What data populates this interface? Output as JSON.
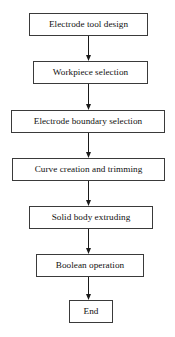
{
  "diagram": {
    "type": "flowchart",
    "orientation": "top-to-bottom",
    "background_color": "#ffffff",
    "box_fill_color": "#ffffff",
    "box_border_color": "#3a3a3a",
    "connector_color": "#1a1a1a",
    "nodes": [
      {
        "id": "n1",
        "label": "Electrode tool design",
        "shape": "rectangle",
        "x": 29,
        "y": 13,
        "w": 119,
        "h": 23
      },
      {
        "id": "n2",
        "label": "Workpiece selection",
        "shape": "rectangle",
        "x": 33,
        "y": 61,
        "w": 115,
        "h": 23
      },
      {
        "id": "n3",
        "label": "Electrode boundary selection",
        "shape": "rectangle",
        "x": 11,
        "y": 110,
        "w": 154,
        "h": 23
      },
      {
        "id": "n4",
        "label": "Curve creation and trimming",
        "shape": "rectangle",
        "x": 12,
        "y": 158,
        "w": 153,
        "h": 23
      },
      {
        "id": "n5",
        "label": "Solid body extruding",
        "shape": "rectangle",
        "x": 29,
        "y": 206,
        "w": 124,
        "h": 23
      },
      {
        "id": "n6",
        "label": "Boolean operation",
        "shape": "rectangle",
        "x": 36,
        "y": 254,
        "w": 108,
        "h": 23
      },
      {
        "id": "n7",
        "label": "End",
        "shape": "rectangle",
        "x": 69,
        "y": 300,
        "w": 44,
        "h": 23
      }
    ],
    "connectors": [
      {
        "id": "c1",
        "from": "n1",
        "to": "n2",
        "arrow": "down",
        "x": 83,
        "y": 36,
        "h": 25
      },
      {
        "id": "c2",
        "from": "n2",
        "to": "n3",
        "arrow": "down",
        "x": 83,
        "y": 84,
        "h": 26
      },
      {
        "id": "c3",
        "from": "n3",
        "to": "n4",
        "arrow": "down",
        "x": 83,
        "y": 133,
        "h": 25
      },
      {
        "id": "c4",
        "from": "n4",
        "to": "n5",
        "arrow": "down",
        "x": 83,
        "y": 181,
        "h": 25
      },
      {
        "id": "c5",
        "from": "n5",
        "to": "n6",
        "arrow": "down",
        "x": 83,
        "y": 229,
        "h": 25
      },
      {
        "id": "c6",
        "from": "n6",
        "to": "n7",
        "arrow": "down",
        "x": 83,
        "y": 277,
        "h": 23
      }
    ]
  }
}
